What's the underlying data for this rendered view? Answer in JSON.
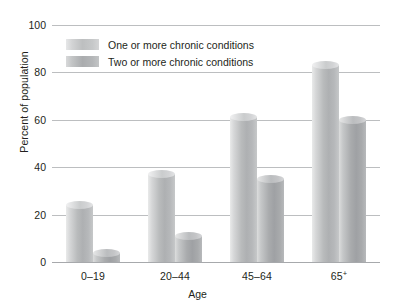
{
  "chart_data": {
    "type": "bar",
    "title": "",
    "xlabel": "Age",
    "ylabel": "Percent of population",
    "categories": [
      "0–19",
      "20–44",
      "45–64",
      "65+"
    ],
    "series": [
      {
        "name": "One or more chronic conditions",
        "values": [
          24,
          37,
          61,
          83
        ],
        "color": "#bdbfc0"
      },
      {
        "name": "Two or more chronic conditions",
        "values": [
          4,
          11,
          35,
          60
        ],
        "color": "#aaacae"
      }
    ],
    "ylim": [
      0,
      100
    ],
    "yticks": [
      0,
      20,
      40,
      60,
      80,
      100
    ],
    "ytick_labels": [
      "0",
      "20",
      "40",
      "60",
      "80",
      "100"
    ],
    "grid": true,
    "legend_position": "upper-left-inside"
  }
}
